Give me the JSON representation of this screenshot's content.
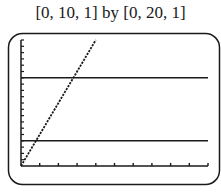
{
  "window_label": "[0, 10, 1] by [0, 20, 1]",
  "chart_data": {
    "type": "line",
    "title": "[0, 10, 1] by [0, 20, 1]",
    "xlabel": "",
    "ylabel": "",
    "xlim": [
      0,
      10
    ],
    "ylim": [
      0,
      20
    ],
    "xscl": 1,
    "yscl": 1,
    "grid": false,
    "legend": null,
    "series": [
      {
        "name": "y1 (increasing line)",
        "x": [
          0,
          4
        ],
        "y": [
          0,
          20
        ]
      },
      {
        "name": "y2 (horizontal line)",
        "x": [
          0,
          10
        ],
        "y": [
          14,
          14
        ]
      },
      {
        "name": "y3 (horizontal line)",
        "x": [
          0,
          10
        ],
        "y": [
          4,
          4
        ]
      }
    ]
  },
  "colors": {
    "ink": "#1a1a1a",
    "background": "#ffffff"
  }
}
